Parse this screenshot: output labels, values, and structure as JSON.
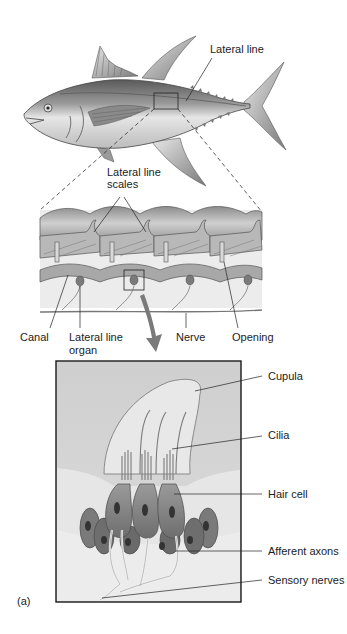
{
  "figure": {
    "panel_label": "(a)",
    "fish": {
      "labels": {
        "lateral_line": "Lateral line"
      }
    },
    "scales_section": {
      "labels": {
        "lateral_line_scales_l1": "Lateral line",
        "lateral_line_scales_l2": "scales",
        "canal": "Canal",
        "lateral_line_organ_l1": "Lateral line",
        "lateral_line_organ_l2": "organ",
        "nerve": "Nerve",
        "opening": "Opening"
      }
    },
    "organ_detail": {
      "labels": {
        "cupula": "Cupula",
        "cilia": "Cilia",
        "hair_cell": "Hair cell",
        "afferent_axons": "Afferent axons",
        "sensory_nerves": "Sensory nerves"
      }
    },
    "colors": {
      "background": "#ffffff",
      "detail_box_fill": "#d4d4d4",
      "arrow": "#7a7a7a",
      "line": "#222222"
    }
  }
}
